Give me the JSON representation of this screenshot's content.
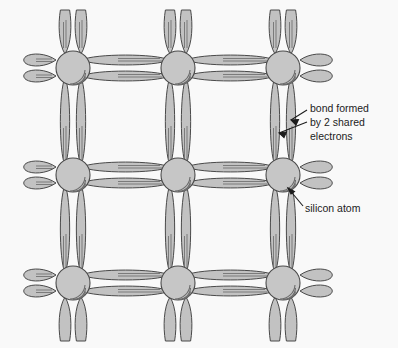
{
  "figure": {
    "background_color": "#f9f9f9",
    "atom_fill": "#c6c6c6",
    "bond_fill": "#c2c2c2",
    "stroke_color": "#4a4a4a",
    "shading_color": "#6b6b6b",
    "width": 398,
    "height": 348
  },
  "lattice": {
    "atom_label": "silicon atom",
    "bond_label": "bond formed by 2 shared electrons",
    "electrons_per_bond": 2,
    "atom_radius": 17,
    "columns_x": [
      73,
      178,
      283
    ],
    "rows_y": [
      68,
      175,
      283
    ],
    "atom_count": 9,
    "atoms": [
      {
        "row": 0,
        "col": 0,
        "cx": 73,
        "cy": 68
      },
      {
        "row": 0,
        "col": 1,
        "cx": 178,
        "cy": 68
      },
      {
        "row": 0,
        "col": 2,
        "cx": 283,
        "cy": 68
      },
      {
        "row": 1,
        "col": 0,
        "cx": 73,
        "cy": 175
      },
      {
        "row": 1,
        "col": 1,
        "cx": 178,
        "cy": 175
      },
      {
        "row": 1,
        "col": 2,
        "cx": 283,
        "cy": 175
      },
      {
        "row": 2,
        "col": 0,
        "cx": 73,
        "cy": 283
      },
      {
        "row": 2,
        "col": 1,
        "cx": 178,
        "cy": 283
      },
      {
        "row": 2,
        "col": 2,
        "cx": 283,
        "cy": 283
      }
    ]
  },
  "annotations": [
    {
      "id": "bond-annotation",
      "lines": [
        "bond formed",
        "by 2 shared",
        "electrons"
      ],
      "text_x": 310,
      "text_y": 112,
      "arrow_count": 2
    },
    {
      "id": "atom-annotation",
      "lines": [
        "silicon atom"
      ],
      "text_x": 305,
      "text_y": 212,
      "arrow_count": 1
    }
  ]
}
